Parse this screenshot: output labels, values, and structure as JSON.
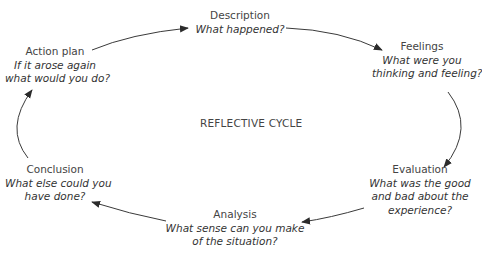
{
  "diagram": {
    "center_label": "REFLECTIVE CYCLE",
    "stages": [
      {
        "title": "Description",
        "question_lines": [
          "What happened?"
        ]
      },
      {
        "title": "Feelings",
        "question_lines": [
          "What were you",
          "thinking and feeling?"
        ]
      },
      {
        "title": "Evaluation",
        "question_lines": [
          "What was the good",
          "and bad about the",
          "experience?"
        ]
      },
      {
        "title": "Analysis",
        "question_lines": [
          "What sense can you make",
          "of the situation?"
        ]
      },
      {
        "title": "Conclusion",
        "question_lines": [
          "What else could you",
          "have done?"
        ]
      },
      {
        "title": "Action plan",
        "question_lines": [
          "If it arose again",
          "what would you do?"
        ]
      }
    ],
    "arrow_color": "#2b2b2b"
  }
}
